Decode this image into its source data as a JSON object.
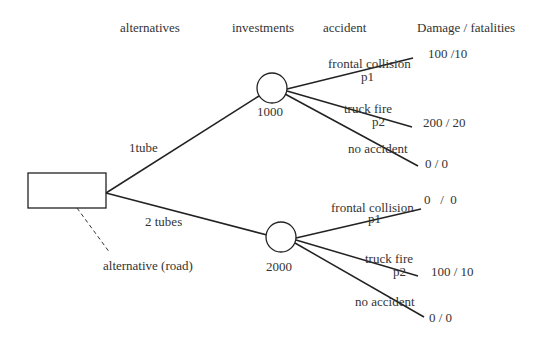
{
  "headers": {
    "alternatives": "alternatives",
    "investments": "investments",
    "accident": "accident",
    "damage": "Damage / fatalities"
  },
  "decision_node": {
    "annotation": "alternative (road)"
  },
  "alternatives": [
    {
      "label": "1tube",
      "investment": "1000",
      "outcomes": [
        {
          "accident": "frontal collision",
          "prob": "p1",
          "damage": "100 /10"
        },
        {
          "accident": "truck fire",
          "prob": "p2",
          "damage": "200 / 20"
        },
        {
          "accident": "no accident",
          "prob": "",
          "damage": "0 / 0"
        }
      ]
    },
    {
      "label": "2 tubes",
      "investment": "2000",
      "outcomes": [
        {
          "accident": "frontal collision",
          "prob": "p1",
          "damage": "0   /  0"
        },
        {
          "accident": "truck fire",
          "prob": "p2",
          "damage": "100 / 10"
        },
        {
          "accident": "no accident",
          "prob": "",
          "damage": "0 / 0"
        }
      ]
    }
  ]
}
